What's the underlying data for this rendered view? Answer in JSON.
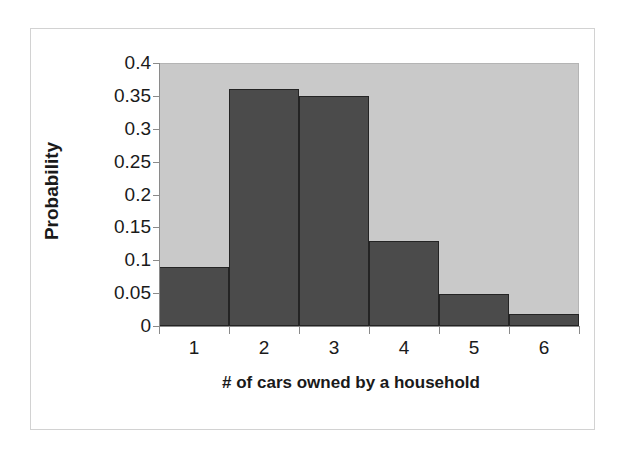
{
  "chart_data": {
    "type": "bar",
    "title": "",
    "subtitle": "",
    "xlabel": "# of cars owned by a household",
    "ylabel": "Probability",
    "categories": [
      "1",
      "2",
      "3",
      "4",
      "5",
      "6"
    ],
    "values": [
      0.09,
      0.36,
      0.35,
      0.13,
      0.048,
      0.018
    ],
    "series": [
      {
        "name": "Probability",
        "values": [
          0.09,
          0.36,
          0.35,
          0.13,
          0.048,
          0.018
        ]
      }
    ],
    "ylim": [
      0,
      0.4
    ],
    "ytick_labels": [
      "0.4",
      "0.35",
      "0.3",
      "0.25",
      "0.2",
      "0.15",
      "0.1",
      "0.05",
      "0"
    ],
    "ytick_values": [
      0.4,
      0.35,
      0.3,
      0.25,
      0.2,
      0.15,
      0.1,
      0.05,
      0
    ],
    "xtick_labels": [
      "1",
      "2",
      "3",
      "4",
      "5",
      "6"
    ],
    "grid": false,
    "legend": false,
    "legend_position": "none",
    "bar_gap": 0,
    "annotations": []
  },
  "style": {
    "plot_background": "#c9c9c9",
    "bar_fill": "#4b4b4b",
    "bar_outline": "#242424",
    "axis_color": "#8a8a8a",
    "frame_color": "#d2d2d2",
    "page_background": "#ffffff",
    "text_color": "#1a1a1a"
  }
}
